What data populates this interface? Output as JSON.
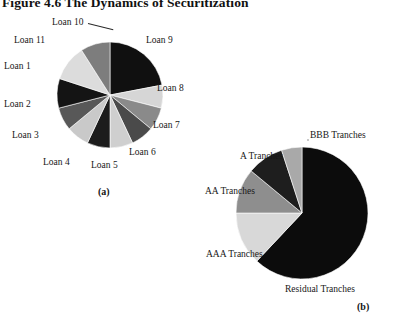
{
  "figure": {
    "title": "Figure 4.6 The Dynamics of Securitization"
  },
  "panels": [
    {
      "id": "a",
      "caption": "(a)",
      "center": {
        "x": 110,
        "y": 95
      },
      "radius": 53
    },
    {
      "id": "b",
      "caption": "(b)",
      "center": {
        "x": 302,
        "y": 213
      },
      "radius": 66
    }
  ],
  "chart_data": [
    {
      "type": "pie",
      "title": "(a)",
      "subtitle": "Pool of individual mortgage loans",
      "categories": [
        "Loan 9",
        "Loan 8",
        "Loan 7",
        "Loan 6",
        "Loan 5",
        "Loan 4",
        "Loan 3",
        "Loan 2",
        "Loan 1",
        "Loan 11",
        "Loan 10"
      ],
      "values": [
        22,
        7,
        7,
        7,
        7,
        7,
        7,
        7,
        9,
        11,
        9
      ],
      "units": "percent of pool",
      "colors": [
        "#101010",
        "#d6d6d6",
        "#8a8a8a",
        "#4a4a4a",
        "#cfcfcf",
        "#1c1c1c",
        "#c9c9c9",
        "#585858",
        "#141414",
        "#dcdcdc",
        "#7d7d7d"
      ],
      "start_angle": 90,
      "direction": "clockwise",
      "legend": "none",
      "labels_position": "outside",
      "grid": false
    },
    {
      "type": "pie",
      "title": "(b)",
      "subtitle": "Securitized tranches issued against the pool",
      "categories": [
        "Residual Tranches",
        "AAA Tranches",
        "AA Tranches",
        "A Tranches",
        "BBB Tranches"
      ],
      "values": [
        62,
        13,
        11,
        9,
        5
      ],
      "units": "percent of issuance",
      "colors": [
        "#0c0c0c",
        "#d8d8d8",
        "#8e8e8e",
        "#1e1e1e",
        "#a9a9a9"
      ],
      "start_angle": 90,
      "direction": "clockwise",
      "legend": "none",
      "labels_position": "outside",
      "grid": false
    }
  ],
  "labels_a": [
    {
      "key": "loan10",
      "text": "Loan 10",
      "x": 52,
      "y": 18
    },
    {
      "key": "loan9",
      "text": "Loan 9",
      "x": 146,
      "y": 36
    },
    {
      "key": "loan11",
      "text": "Loan 11",
      "x": 14,
      "y": 36
    },
    {
      "key": "loan1",
      "text": "Loan 1",
      "x": 4,
      "y": 62
    },
    {
      "key": "loan8",
      "text": "Loan 8",
      "x": 157,
      "y": 84
    },
    {
      "key": "loan2",
      "text": "Loan 2",
      "x": 4,
      "y": 100
    },
    {
      "key": "loan7",
      "text": "Loan 7",
      "x": 153,
      "y": 121
    },
    {
      "key": "loan3",
      "text": "Loan 3",
      "x": 12,
      "y": 131
    },
    {
      "key": "loan6",
      "text": "Loan 6",
      "x": 129,
      "y": 148
    },
    {
      "key": "loan4",
      "text": "Loan 4",
      "x": 43,
      "y": 158
    },
    {
      "key": "loan5",
      "text": "Loan 5",
      "x": 91,
      "y": 161
    }
  ],
  "labels_b": [
    {
      "key": "bbb",
      "text": "BBB Tranches",
      "x": 310,
      "y": 131
    },
    {
      "key": "a",
      "text": "A Tranches",
      "x": 240,
      "y": 152
    },
    {
      "key": "aa",
      "text": "AA Tranches",
      "x": 205,
      "y": 187
    },
    {
      "key": "aaa",
      "text": "AAA Tranches",
      "x": 206,
      "y": 250
    },
    {
      "key": "residual",
      "text": "Residual Tranches",
      "x": 285,
      "y": 285
    }
  ]
}
